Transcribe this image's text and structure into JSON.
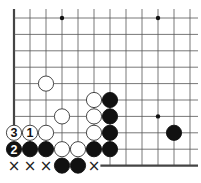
{
  "diagram": {
    "type": "go-board",
    "grid": {
      "origin_x": 14,
      "origin_y": 18,
      "dx": 16,
      "dy": 16.4,
      "cols": 12,
      "rows": 10,
      "line_color": "#555555",
      "edge_color": "#444444",
      "left_edge": true,
      "bottom_edge_from_col": 5.4
    },
    "star_points": [
      {
        "col": 3,
        "row": 0
      },
      {
        "col": 9,
        "row": 0
      },
      {
        "col": 9,
        "row": 6
      }
    ],
    "stones": [
      {
        "col": 2,
        "row": 4,
        "color": "white"
      },
      {
        "col": 5,
        "row": 5,
        "color": "white"
      },
      {
        "col": 6,
        "row": 5,
        "color": "black"
      },
      {
        "col": 3,
        "row": 6,
        "color": "white"
      },
      {
        "col": 5,
        "row": 6,
        "color": "white"
      },
      {
        "col": 6,
        "row": 6,
        "color": "black"
      },
      {
        "col": 0,
        "row": 7,
        "color": "white",
        "label": "3"
      },
      {
        "col": 1,
        "row": 7,
        "color": "white",
        "label": "1"
      },
      {
        "col": 2,
        "row": 7,
        "color": "white"
      },
      {
        "col": 5,
        "row": 7,
        "color": "white"
      },
      {
        "col": 6,
        "row": 7,
        "color": "black"
      },
      {
        "col": 10,
        "row": 7,
        "color": "black"
      },
      {
        "col": 0,
        "row": 8,
        "color": "black",
        "label": "2"
      },
      {
        "col": 1,
        "row": 8,
        "color": "black"
      },
      {
        "col": 2,
        "row": 8,
        "color": "black"
      },
      {
        "col": 3,
        "row": 8,
        "color": "white"
      },
      {
        "col": 4,
        "row": 8,
        "color": "white"
      },
      {
        "col": 5,
        "row": 8,
        "color": "black"
      },
      {
        "col": 6,
        "row": 8,
        "color": "black"
      },
      {
        "col": 3,
        "row": 9,
        "color": "black"
      },
      {
        "col": 4,
        "row": 9,
        "color": "black"
      }
    ],
    "markers": [
      {
        "col": 0,
        "row": 9,
        "symbol": "×"
      },
      {
        "col": 1,
        "row": 9,
        "symbol": "×"
      },
      {
        "col": 2,
        "row": 9,
        "symbol": "×"
      },
      {
        "col": 5,
        "row": 9,
        "symbol": "×"
      }
    ],
    "colors": {
      "black_stone": "#111111",
      "white_stone": "#ffffff",
      "stone_outline": "#333333",
      "star_point": "#111111"
    }
  }
}
